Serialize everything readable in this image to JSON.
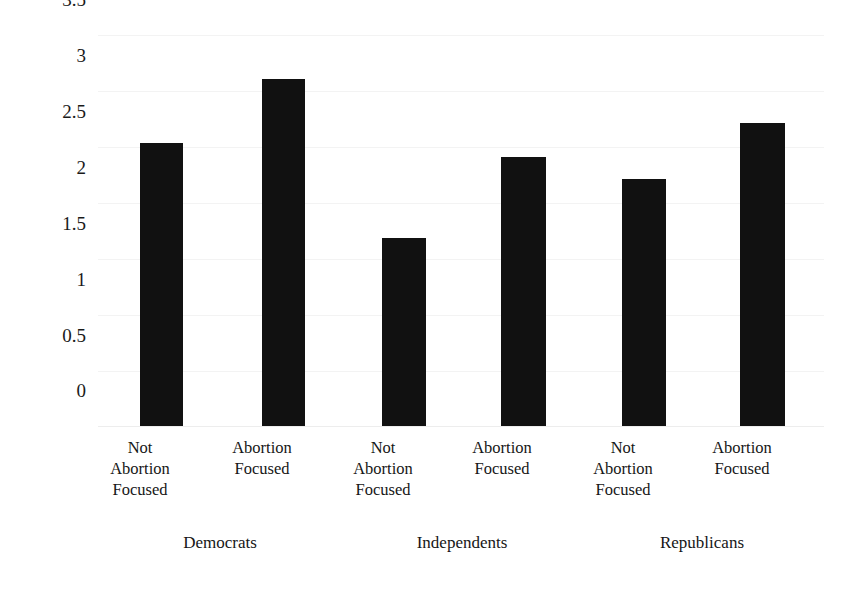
{
  "chart_data": {
    "type": "bar",
    "title": "",
    "xlabel": "",
    "ylabel": "Mean Acts of Participation",
    "ylim": [
      0,
      3.5
    ],
    "ytick_labels": [
      "3.5",
      "3",
      "2.5",
      "2",
      "1.5",
      "1",
      "0.5",
      "0"
    ],
    "ytick_values": [
      3.5,
      3,
      2.5,
      2,
      1.5,
      1,
      0.5,
      0
    ],
    "grid": true,
    "legend": "none",
    "bar_color": "#111111",
    "gridline_color": "#f3f3f3",
    "categories": [
      "Not Abortion Focused",
      "Abortion Focused",
      "Not Abortion Focused",
      "Abortion Focused",
      "Not Abortion Focused",
      "Abortion Focused"
    ],
    "values": [
      2.53,
      3.11,
      1.68,
      2.41,
      2.21,
      2.71
    ],
    "groups": [
      "Democrats",
      "Independents",
      "Republicans"
    ],
    "bars": [
      {
        "group": "Democrats",
        "category": "Not Abortion Focused",
        "label_lines": [
          "Not",
          "Abortion",
          "Focused"
        ],
        "value": 2.53
      },
      {
        "group": "Democrats",
        "category": "Abortion Focused",
        "label_lines": [
          "Abortion",
          "Focused"
        ],
        "value": 3.11
      },
      {
        "group": "Independents",
        "category": "Not Abortion Focused",
        "label_lines": [
          "Not",
          "Abortion",
          "Focused"
        ],
        "value": 1.68
      },
      {
        "group": "Independents",
        "category": "Abortion Focused",
        "label_lines": [
          "Abortion",
          "Focused"
        ],
        "value": 2.41
      },
      {
        "group": "Republicans",
        "category": "Not Abortion Focused",
        "label_lines": [
          "Not",
          "Abortion",
          "Focused"
        ],
        "value": 2.21
      },
      {
        "group": "Republicans",
        "category": "Abortion Focused",
        "label_lines": [
          "Abortion",
          "Focused"
        ],
        "value": 2.71
      }
    ]
  },
  "axis": {
    "y_title": "Mean Acts of Participation"
  },
  "ticks": {
    "t0": "3.5",
    "t1": "3",
    "t2": "2.5",
    "t3": "2",
    "t4": "1.5",
    "t5": "1",
    "t6": "0.5",
    "t7": "0"
  },
  "bar_labels": {
    "b0": {
      "l0": "Not",
      "l1": "Abortion",
      "l2": "Focused"
    },
    "b1": {
      "l0": "Abortion",
      "l1": "Focused",
      "l2": ""
    },
    "b2": {
      "l0": "Not",
      "l1": "Abortion",
      "l2": "Focused"
    },
    "b3": {
      "l0": "Abortion",
      "l1": "Focused",
      "l2": ""
    },
    "b4": {
      "l0": "Not",
      "l1": "Abortion",
      "l2": "Focused"
    },
    "b5": {
      "l0": "Abortion",
      "l1": "Focused",
      "l2": ""
    }
  },
  "groups": {
    "g0": "Democrats",
    "g1": "Independents",
    "g2": "Republicans"
  }
}
